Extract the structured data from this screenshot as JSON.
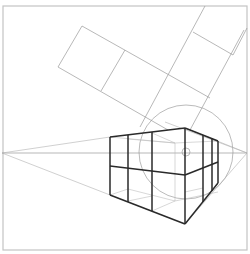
{
  "diagram": {
    "title": "",
    "type": "two-point perspective construction",
    "colors": {
      "background": "#ffffff",
      "frame": "#c4c4c4",
      "construction_lines": "#9a9a9a",
      "box_edges": "#2a2a2a"
    },
    "frame": {
      "x": 3,
      "y": 6,
      "width": 244,
      "height": 244
    },
    "horizon": {
      "y": 153,
      "x1": 2,
      "x2": 247
    },
    "vanishing_points": [
      {
        "name": "left",
        "x": 2,
        "y": 153
      },
      {
        "name": "right",
        "x": 247,
        "y": 153
      }
    ],
    "cone_of_vision": {
      "cx": 186,
      "cy": 152,
      "r": 47
    },
    "center_of_vision": {
      "cx": 186,
      "cy": 152,
      "r": 4
    },
    "box": {
      "front_edge": {
        "x": 185,
        "top": 128,
        "middle": 175,
        "bottom": 224
      },
      "left_face_verticals_x": [
        110,
        128,
        152
      ],
      "right_face_verticals_x": [
        203,
        212,
        218
      ]
    },
    "rotated_plan_grid": {
      "cells": 2,
      "orientation": "tilted about 30 degrees"
    }
  }
}
